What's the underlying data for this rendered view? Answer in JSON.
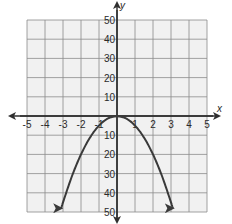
{
  "chart_data": {
    "type": "line",
    "title": "",
    "xlabel": "x",
    "ylabel": "y",
    "xlim": [
      -5,
      5
    ],
    "ylim": [
      -50,
      50
    ],
    "x_ticks": [
      -5,
      -4,
      -3,
      -2,
      -1,
      1,
      2,
      3,
      4,
      5
    ],
    "x_tick_labels": [
      "-5",
      "-4",
      "-3",
      "-2",
      "-1",
      "1",
      "2",
      "3",
      "4",
      "5"
    ],
    "y_ticks": [
      50,
      40,
      30,
      20,
      10,
      -10,
      -20,
      -30,
      -40,
      -50
    ],
    "y_tick_labels": [
      "50",
      "40",
      "30",
      "20",
      "10",
      "10",
      "20",
      "30",
      "40",
      "50"
    ],
    "grid": true,
    "series": [
      {
        "name": "parabola",
        "equation": "y = -5x^2",
        "x": [
          -3.1,
          -3,
          -2.5,
          -2,
          -1.5,
          -1,
          -0.5,
          0,
          0.5,
          1,
          1.5,
          2,
          2.5,
          3,
          3.1
        ],
        "y": [
          -48.05,
          -45,
          -31.25,
          -20,
          -11.25,
          -5,
          -1.25,
          0,
          -1.25,
          -5,
          -11.25,
          -20,
          -31.25,
          -45,
          -48.05
        ],
        "arrows_at_ends": true,
        "color": "#3a3a3a"
      }
    ],
    "colors": {
      "grid": "#8c8c8c",
      "grid_background": "#f1f1f1",
      "axis": "#2f2f2f",
      "curve": "#3a3a3a"
    }
  }
}
